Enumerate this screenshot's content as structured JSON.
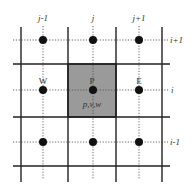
{
  "diagram": {
    "colors": {
      "background": "#ffffff",
      "grid_line": "#222222",
      "dotted_line": "#555555",
      "node": "#111111",
      "control_volume_fill": "#9a9a9a",
      "control_volume_border": "#222222",
      "label": "#333333"
    },
    "column_labels": [
      "j-1",
      "j",
      "j+1"
    ],
    "row_labels": [
      "i+1",
      "i",
      "i-1"
    ],
    "node_labels": {
      "west": "W",
      "center": "P",
      "east": "E",
      "center_variables": "p,v,w"
    },
    "solid_vertical_x": [
      21,
      68,
      116,
      162
    ],
    "solid_horizontal_y": [
      64,
      117,
      166
    ],
    "node_columns_x": [
      43,
      93,
      139
    ],
    "node_rows_y": [
      40,
      90,
      142
    ],
    "control_volume": {
      "x": 68,
      "y": 64,
      "width": 48,
      "height": 53
    }
  }
}
